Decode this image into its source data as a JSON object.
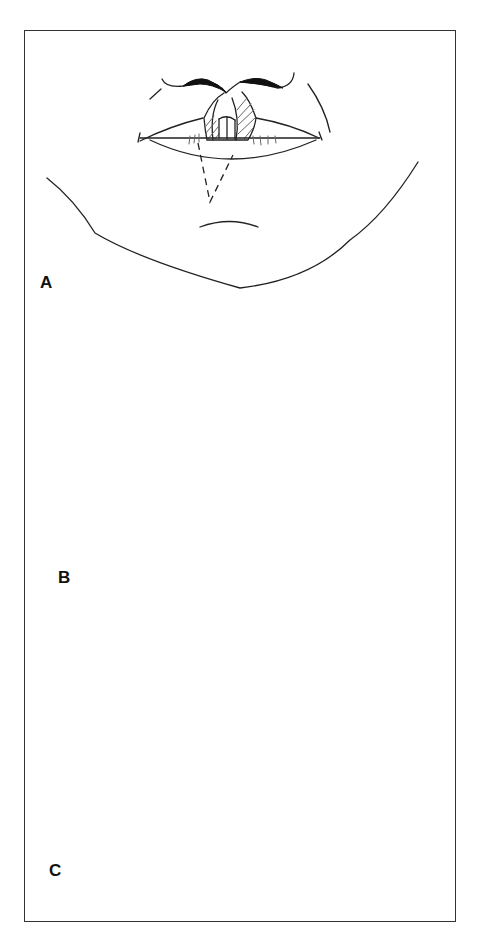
{
  "figure": {
    "panels": [
      {
        "label": "A",
        "content": "upper lip defect with hatched excision area and dashed lower-lip flap outline"
      },
      {
        "label": "B",
        "content": "lower lip flap rotated into upper lip defect, sutured"
      },
      {
        "label": "C",
        "content": "flap divided and inset, sutured upper and lower lip"
      }
    ]
  }
}
